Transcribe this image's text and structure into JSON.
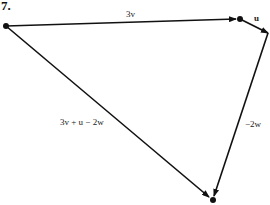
{
  "problem": {
    "number": "7."
  },
  "diagram": {
    "points": {
      "origin": [
        6,
        26
      ],
      "after_3v": [
        240,
        19
      ],
      "after_u": [
        268,
        33
      ],
      "end": [
        213,
        200
      ]
    },
    "vectors": [
      {
        "id": "v3",
        "label": "3v",
        "from": "origin",
        "to": "after_3v"
      },
      {
        "id": "u",
        "label": "u",
        "from": "after_3v",
        "to": "after_u"
      },
      {
        "id": "neg2w",
        "label": "−2w",
        "from": "after_u",
        "to": "end"
      },
      {
        "id": "resultant",
        "label": "3v + u − 2w",
        "from": "origin",
        "to": "end"
      }
    ],
    "colors": {
      "stroke": "#111111",
      "text": "#222222"
    }
  }
}
